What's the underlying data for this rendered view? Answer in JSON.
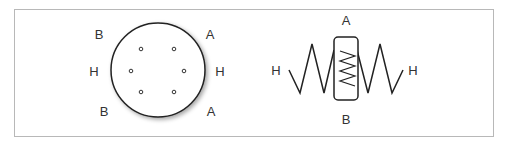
{
  "figure": {
    "left_diagram": {
      "name": "round-connector",
      "labels": {
        "top_left": "B",
        "top_right": "A",
        "mid_left": "H",
        "mid_right": "H",
        "bottom_left": "B",
        "bottom_right": "A"
      },
      "pin_count": 6
    },
    "right_diagram": {
      "name": "potentiometer-symbol",
      "labels": {
        "top": "A",
        "bottom": "B",
        "left": "H",
        "right": "H"
      }
    }
  }
}
